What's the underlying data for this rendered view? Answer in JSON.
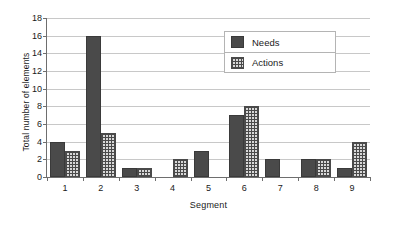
{
  "chart_data": {
    "type": "bar",
    "title": "",
    "xlabel": "Segment",
    "ylabel": "Total number of elements",
    "categories": [
      "1",
      "2",
      "3",
      "4",
      "5",
      "6",
      "7",
      "8",
      "9"
    ],
    "series": [
      {
        "name": "Needs",
        "color": "#4a4a4a",
        "pattern": "solid",
        "values": [
          4,
          16,
          1,
          0,
          3,
          7,
          2,
          2,
          1
        ]
      },
      {
        "name": "Actions",
        "color": "#4a4a4a",
        "pattern": "crosshatch",
        "values": [
          3,
          5,
          1,
          2,
          0,
          8,
          0,
          2,
          4
        ]
      }
    ],
    "ylim": [
      0,
      18
    ],
    "ytick_step": 2,
    "yticks": [
      0,
      2,
      4,
      6,
      8,
      10,
      12,
      14,
      16,
      18
    ],
    "grid": "horizontal",
    "legend_position": "top-right",
    "legend_entries": [
      "Needs",
      "Actions"
    ]
  }
}
